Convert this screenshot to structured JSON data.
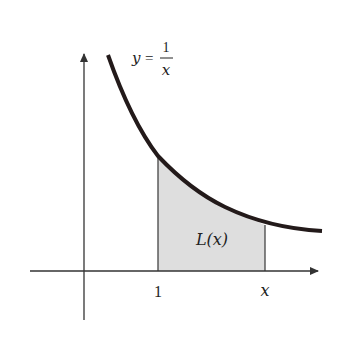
{
  "diagram": {
    "curve_label": {
      "lhs": "y",
      "eq": "=",
      "numerator": "1",
      "denominator": "x"
    },
    "region_label": "L(x)",
    "x_tick_labels": [
      "1",
      "x"
    ],
    "colors": {
      "curve": "#231a1a",
      "axes": "#333333",
      "region_fill": "#dedede",
      "region_edge": "#444444",
      "background": "#ffffff"
    }
  }
}
